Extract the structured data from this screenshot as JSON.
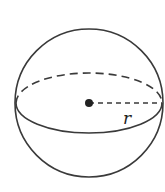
{
  "diagram": {
    "type": "sphere",
    "radius_label": "r",
    "stroke_color": "#3a3a3a",
    "parts": [
      "outer-circle",
      "back-equator-dashed",
      "front-equator-solid",
      "center-point",
      "radius-dashed"
    ]
  }
}
